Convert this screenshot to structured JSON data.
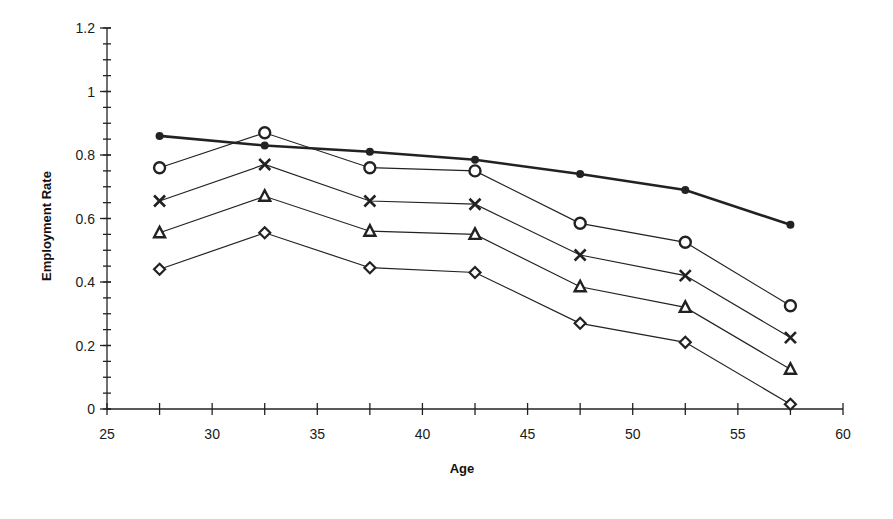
{
  "chart_data": {
    "type": "line",
    "title": "",
    "xlabel": "Age",
    "ylabel": "Employment Rate",
    "xlim": [
      25,
      60
    ],
    "ylim": [
      0,
      1.2
    ],
    "x_ticks": [
      25,
      30,
      35,
      40,
      45,
      50,
      55,
      60
    ],
    "x_tick_labels": [
      "25",
      "30",
      "35",
      "40",
      "45",
      "50",
      "55",
      "60"
    ],
    "x_minor_ticks": [
      27.5,
      32.5,
      37.5,
      42.5,
      47.5,
      52.5,
      57.5
    ],
    "y_ticks": [
      0,
      0.2,
      0.4,
      0.6,
      0.8,
      1.0,
      1.2
    ],
    "y_tick_labels": [
      "0",
      "0.2",
      "0.4",
      "0.6",
      "0.8",
      "1",
      "1.2"
    ],
    "y_minor_step": 0.05,
    "grid": false,
    "legend": null,
    "x": [
      27.5,
      32.5,
      37.5,
      42.5,
      47.5,
      52.5,
      57.5
    ],
    "series": [
      {
        "name": "Series 1 (filled dot, bold line)",
        "marker": "filled-circle",
        "line": "bold",
        "values": [
          0.86,
          0.83,
          0.81,
          0.785,
          0.74,
          0.69,
          0.58
        ]
      },
      {
        "name": "Series 2 (open circle)",
        "marker": "open-circle",
        "line": "thin",
        "values": [
          0.76,
          0.87,
          0.76,
          0.75,
          0.585,
          0.525,
          0.325
        ]
      },
      {
        "name": "Series 3 (cross)",
        "marker": "cross",
        "line": "thin",
        "values": [
          0.655,
          0.77,
          0.655,
          0.645,
          0.485,
          0.42,
          0.225
        ]
      },
      {
        "name": "Series 4 (triangle)",
        "marker": "triangle",
        "line": "thin",
        "values": [
          0.555,
          0.67,
          0.56,
          0.55,
          0.385,
          0.32,
          0.125
        ]
      },
      {
        "name": "Series 5 (diamond)",
        "marker": "diamond",
        "line": "thin",
        "values": [
          0.44,
          0.555,
          0.445,
          0.43,
          0.27,
          0.21,
          0.015
        ]
      }
    ]
  },
  "colors": {
    "ink": "#222222",
    "background": "#ffffff"
  }
}
